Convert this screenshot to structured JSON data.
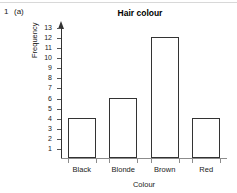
{
  "page": {
    "question_number": "1",
    "question_part": "(a)"
  },
  "chart_data": {
    "type": "bar",
    "title": "Hair colour",
    "xlabel": "Colour",
    "ylabel": "Frequency",
    "categories": [
      "Black",
      "Blonde",
      "Brown",
      "Red"
    ],
    "values": [
      4,
      6,
      12,
      4
    ],
    "ylim": [
      0,
      13
    ],
    "ytick_labels": [
      "13",
      "12",
      "11",
      "10",
      "9",
      "8",
      "7",
      "6",
      "5",
      "4",
      "3",
      "2",
      "1"
    ],
    "ytick_values": [
      13,
      12,
      11,
      10,
      9,
      8,
      7,
      6,
      5,
      4,
      3,
      2,
      1
    ],
    "grid": false,
    "legend": false,
    "bar_fill": "#ffffff",
    "bar_edge": "#333333",
    "axis_color": "#8c8c8c"
  }
}
